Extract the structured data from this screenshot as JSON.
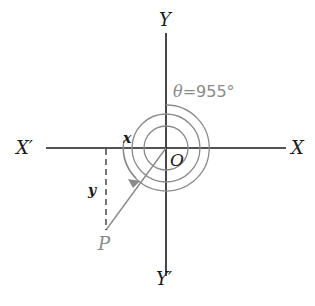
{
  "diagram": {
    "labels": {
      "y_axis_top": "Y",
      "y_axis_bottom": "Y′",
      "x_axis_right": "X",
      "x_axis_left": "X′",
      "origin": "O",
      "point": "P",
      "x_segment": "x",
      "y_segment": "y",
      "angle_prefix": "θ",
      "angle_value": "=955°"
    },
    "colors": {
      "axes": "#1a1a1a",
      "spiral": "#8a8a8a",
      "ray": "#8a8a8a",
      "text_dark": "#1a1a1a",
      "text_gray": "#8a8a8a"
    },
    "angle_degrees": 955
  }
}
